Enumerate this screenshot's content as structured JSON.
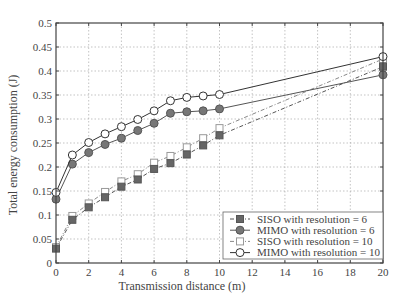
{
  "chart_data": {
    "type": "line",
    "title": "",
    "xlabel": "Transmission distance (m)",
    "ylabel": "Total energy consumption (J)",
    "xlim": [
      0,
      20
    ],
    "ylim": [
      0,
      0.5
    ],
    "xticks": [
      0,
      2,
      4,
      6,
      8,
      10,
      12,
      14,
      16,
      18,
      20
    ],
    "yticks": [
      0,
      0.05,
      0.1,
      0.15,
      0.2,
      0.25,
      0.3,
      0.35,
      0.4,
      0.45,
      0.5
    ],
    "ytick_labels": [
      "0",
      "0.05",
      "0.1",
      "0.15",
      "0.2",
      "0.25",
      "0.3",
      "0.35",
      "0.4",
      "0.45",
      "0.5"
    ],
    "grid": true,
    "legend_position": "lower right",
    "x": [
      0,
      1,
      2,
      3,
      4,
      5,
      6,
      7,
      8,
      9,
      10,
      20
    ],
    "series": [
      {
        "name": "SISO with resolution = 6",
        "marker": "square-filled",
        "line": "dashdot",
        "color": "#555555",
        "values": [
          0.03,
          0.09,
          0.116,
          0.137,
          0.159,
          0.174,
          0.196,
          0.208,
          0.226,
          0.245,
          0.266,
          0.409
        ]
      },
      {
        "name": "MIMO with resolution = 6",
        "marker": "circle-filled",
        "line": "solid",
        "color": "#555555",
        "values": [
          0.133,
          0.206,
          0.23,
          0.247,
          0.26,
          0.276,
          0.291,
          0.312,
          0.315,
          0.317,
          0.321,
          0.392
        ]
      },
      {
        "name": "SISO with resolution = 10",
        "marker": "square-open",
        "line": "dashdot",
        "color": "#888888",
        "values": [
          0.033,
          0.098,
          0.124,
          0.148,
          0.17,
          0.185,
          0.209,
          0.223,
          0.241,
          0.26,
          0.281,
          0.425
        ]
      },
      {
        "name": "MIMO with resolution = 10",
        "marker": "circle-open",
        "line": "solid",
        "color": "#333333",
        "values": [
          0.147,
          0.225,
          0.251,
          0.269,
          0.284,
          0.299,
          0.317,
          0.338,
          0.345,
          0.348,
          0.351,
          0.43
        ]
      }
    ]
  }
}
